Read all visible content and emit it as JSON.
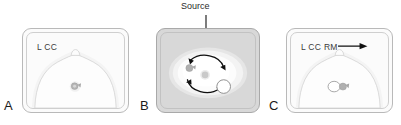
{
  "figure": {
    "background_color": "#ffffff"
  },
  "annotations": {
    "source_label": "Source",
    "source_arrow": "down-arrow-icon"
  },
  "panels": [
    {
      "letter": "A",
      "name": "panel-a",
      "view_label": "L CC",
      "background_color": "#fbfbfb",
      "projection": "craniocaudal",
      "contents": [
        "breast-outline",
        "nipple",
        "marker-clip"
      ],
      "has_arrow": false
    },
    {
      "letter": "B",
      "name": "panel-b",
      "view_label": "",
      "background_color": "#d8d8d8",
      "projection": "axial-rotation",
      "contents": [
        "breast-mass-region",
        "rotation-arrows",
        "marker-clip",
        "center-dot",
        "white-circle-lesion"
      ],
      "has_arrow": false
    },
    {
      "letter": "C",
      "name": "panel-c",
      "view_label": "L CC RM",
      "background_color": "#fbfbfb",
      "projection": "craniocaudal-rolled-medial",
      "contents": [
        "breast-outline",
        "nipple",
        "white-circle-lesion",
        "marker-clip"
      ],
      "has_arrow": true,
      "arrow_icon": "right-arrow-icon"
    }
  ],
  "colors": {
    "panel_border": "#b9b9b9",
    "panel_inner_border": "#cfcfcf",
    "panel_b_fill": "#d8d8d8",
    "breast_fill": "#fdfdfd",
    "breast_stroke": "#d0d0d0",
    "clip_gray": "#a8a8a8",
    "lesion_white": "#ffffff",
    "lesion_stroke": "#9a9a9a",
    "arrow_black": "#111111",
    "text": "#2b2b2b"
  }
}
